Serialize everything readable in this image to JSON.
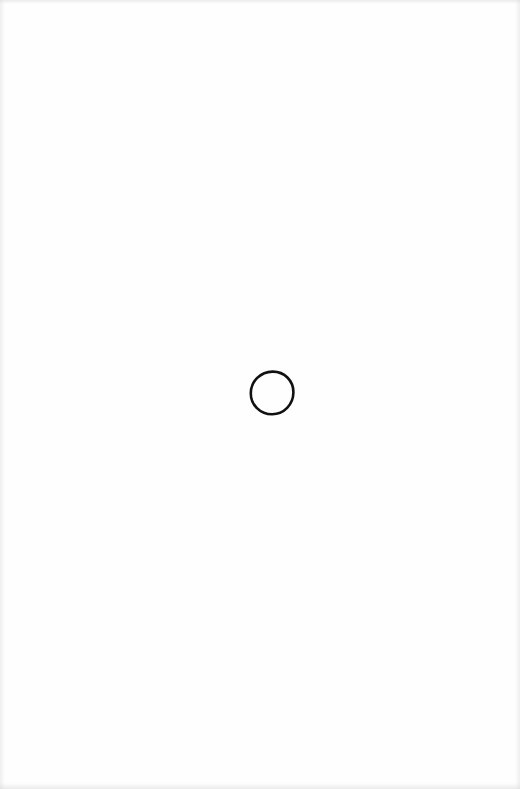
{
  "page": {
    "background": "#fefefe",
    "width": 520,
    "height": 789
  },
  "drawing": {
    "shape": "circle",
    "icon": "hand-drawn-circle-icon",
    "center": [
      272,
      393
    ],
    "diameter": 44,
    "stroke_color": "#111111",
    "stroke_width": 2.6,
    "fill": "none"
  }
}
